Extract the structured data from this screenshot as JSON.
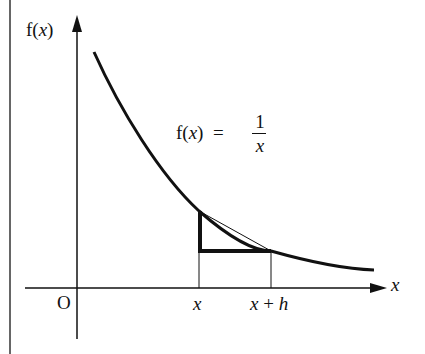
{
  "diagram": {
    "y_axis_label_prefix": "f(",
    "y_axis_label_var": "x",
    "y_axis_label_suffix": ")",
    "x_axis_label": "x",
    "origin_label": "O",
    "function_label_prefix": "f(",
    "function_label_var": "x",
    "function_label_suffix": ")  =",
    "fraction_numerator": "1",
    "fraction_denominator": "x",
    "tick_x": "x",
    "tick_x_plus_h_x": "x",
    "tick_x_plus_h_plus": " + ",
    "tick_x_plus_h_h": "h",
    "colors": {
      "ink": "#111111",
      "background": "#ffffff"
    }
  }
}
